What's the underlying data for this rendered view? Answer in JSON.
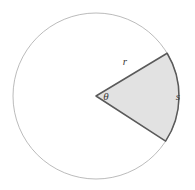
{
  "figure": {
    "background_color": "#ffffff",
    "labels": {
      "radius": "r",
      "angle": "θ",
      "arc_length": "s"
    }
  },
  "chart_data": {
    "type": "pie",
    "xlabel": "",
    "ylabel": "",
    "categories": [
      "sector",
      "remainder"
    ],
    "values": [
      64,
      296
    ],
    "annotations": [
      {
        "name": "radius-label",
        "text": "r",
        "x": 125,
        "y": 62
      },
      {
        "name": "angle-label",
        "text": "θ",
        "x": 106,
        "y": 97
      },
      {
        "name": "arc-length-label",
        "text": "s",
        "x": 178,
        "y": 97
      }
    ],
    "geometry": {
      "center_x": 96,
      "center_y": 96,
      "radius": 83,
      "start_angle_deg": -31,
      "end_angle_deg": 33,
      "sector_angle_deg": 64
    },
    "colors": {
      "circle_stroke": "#b3b3b3",
      "sector_fill": "#e2e2e2",
      "sector_stroke": "#5a5a5a",
      "label_color": "#3a3a3a"
    },
    "grid": false,
    "legend": "none"
  }
}
